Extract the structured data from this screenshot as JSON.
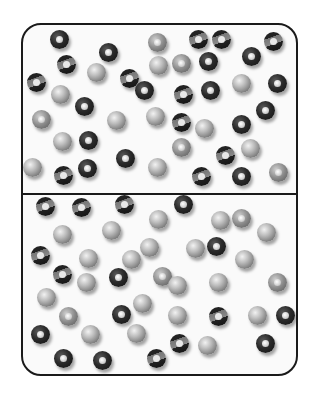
{
  "figure": {
    "colors": {
      "border": "#1a1a1a",
      "background": "#fafafa"
    },
    "top_chamber": {
      "balls": [
        {
          "x": 27,
          "y": 5,
          "t": "dark"
        },
        {
          "x": 76,
          "y": 18,
          "t": "dark"
        },
        {
          "x": 125,
          "y": 8,
          "t": "grey"
        },
        {
          "x": 166,
          "y": 5,
          "t": "stripe"
        },
        {
          "x": 189,
          "y": 5,
          "t": "stripe"
        },
        {
          "x": 241,
          "y": 7,
          "t": "stripe"
        },
        {
          "x": 34,
          "y": 30,
          "t": "stripe"
        },
        {
          "x": 64,
          "y": 38,
          "t": "solid"
        },
        {
          "x": 97,
          "y": 44,
          "t": "stripe"
        },
        {
          "x": 126,
          "y": 31,
          "t": "solid"
        },
        {
          "x": 149,
          "y": 29,
          "t": "grey"
        },
        {
          "x": 176,
          "y": 27,
          "t": "dark"
        },
        {
          "x": 219,
          "y": 22,
          "t": "dark"
        },
        {
          "x": 4,
          "y": 48,
          "t": "stripe"
        },
        {
          "x": 28,
          "y": 60,
          "t": "solid"
        },
        {
          "x": 112,
          "y": 56,
          "t": "dark"
        },
        {
          "x": 151,
          "y": 60,
          "t": "stripe"
        },
        {
          "x": 178,
          "y": 56,
          "t": "dark"
        },
        {
          "x": 209,
          "y": 49,
          "t": "solid"
        },
        {
          "x": 245,
          "y": 49,
          "t": "dark"
        },
        {
          "x": 52,
          "y": 72,
          "t": "dark"
        },
        {
          "x": 9,
          "y": 85,
          "t": "grey"
        },
        {
          "x": 84,
          "y": 86,
          "t": "solid"
        },
        {
          "x": 123,
          "y": 82,
          "t": "solid"
        },
        {
          "x": 149,
          "y": 88,
          "t": "stripe"
        },
        {
          "x": 172,
          "y": 94,
          "t": "solid"
        },
        {
          "x": 209,
          "y": 90,
          "t": "dark"
        },
        {
          "x": 233,
          "y": 76,
          "t": "dark"
        },
        {
          "x": 30,
          "y": 107,
          "t": "solid"
        },
        {
          "x": 56,
          "y": 106,
          "t": "dark"
        },
        {
          "x": 149,
          "y": 113,
          "t": "grey"
        },
        {
          "x": 193,
          "y": 121,
          "t": "stripe"
        },
        {
          "x": 218,
          "y": 114,
          "t": "solid"
        },
        {
          "x": 93,
          "y": 124,
          "t": "dark"
        },
        {
          "x": 125,
          "y": 133,
          "t": "solid"
        },
        {
          "x": 31,
          "y": 141,
          "t": "stripe"
        },
        {
          "x": 55,
          "y": 134,
          "t": "dark"
        },
        {
          "x": 169,
          "y": 142,
          "t": "stripe"
        },
        {
          "x": 209,
          "y": 142,
          "t": "dark"
        },
        {
          "x": 246,
          "y": 138,
          "t": "grey"
        },
        {
          "x": 0,
          "y": 133,
          "t": "solid"
        }
      ]
    },
    "bottom_chamber": {
      "balls": [
        {
          "x": 13,
          "y": 2,
          "t": "stripe"
        },
        {
          "x": 49,
          "y": 3,
          "t": "stripe"
        },
        {
          "x": 92,
          "y": 0,
          "t": "stripe"
        },
        {
          "x": 126,
          "y": 15,
          "t": "solid"
        },
        {
          "x": 151,
          "y": 0,
          "t": "dark"
        },
        {
          "x": 188,
          "y": 16,
          "t": "solid"
        },
        {
          "x": 209,
          "y": 14,
          "t": "grey"
        },
        {
          "x": 234,
          "y": 28,
          "t": "solid"
        },
        {
          "x": 30,
          "y": 30,
          "t": "solid"
        },
        {
          "x": 79,
          "y": 26,
          "t": "solid"
        },
        {
          "x": 163,
          "y": 44,
          "t": "solid"
        },
        {
          "x": 117,
          "y": 43,
          "t": "solid"
        },
        {
          "x": 184,
          "y": 42,
          "t": "dark"
        },
        {
          "x": 212,
          "y": 55,
          "t": "solid"
        },
        {
          "x": 8,
          "y": 51,
          "t": "stripe"
        },
        {
          "x": 56,
          "y": 54,
          "t": "solid"
        },
        {
          "x": 99,
          "y": 55,
          "t": "solid"
        },
        {
          "x": 30,
          "y": 70,
          "t": "stripe"
        },
        {
          "x": 54,
          "y": 78,
          "t": "solid"
        },
        {
          "x": 86,
          "y": 73,
          "t": "dark"
        },
        {
          "x": 130,
          "y": 72,
          "t": "grey"
        },
        {
          "x": 145,
          "y": 81,
          "t": "solid"
        },
        {
          "x": 186,
          "y": 78,
          "t": "solid"
        },
        {
          "x": 245,
          "y": 78,
          "t": "grey"
        },
        {
          "x": 14,
          "y": 93,
          "t": "solid"
        },
        {
          "x": 36,
          "y": 112,
          "t": "grey"
        },
        {
          "x": 89,
          "y": 110,
          "t": "dark"
        },
        {
          "x": 110,
          "y": 99,
          "t": "solid"
        },
        {
          "x": 145,
          "y": 111,
          "t": "solid"
        },
        {
          "x": 186,
          "y": 112,
          "t": "stripe"
        },
        {
          "x": 225,
          "y": 111,
          "t": "solid"
        },
        {
          "x": 253,
          "y": 111,
          "t": "dark"
        },
        {
          "x": 8,
          "y": 130,
          "t": "dark"
        },
        {
          "x": 58,
          "y": 130,
          "t": "solid"
        },
        {
          "x": 104,
          "y": 129,
          "t": "solid"
        },
        {
          "x": 147,
          "y": 139,
          "t": "stripe"
        },
        {
          "x": 175,
          "y": 141,
          "t": "solid"
        },
        {
          "x": 233,
          "y": 139,
          "t": "dark"
        },
        {
          "x": 31,
          "y": 154,
          "t": "dark"
        },
        {
          "x": 70,
          "y": 156,
          "t": "dark"
        },
        {
          "x": 124,
          "y": 154,
          "t": "stripe"
        }
      ]
    }
  }
}
